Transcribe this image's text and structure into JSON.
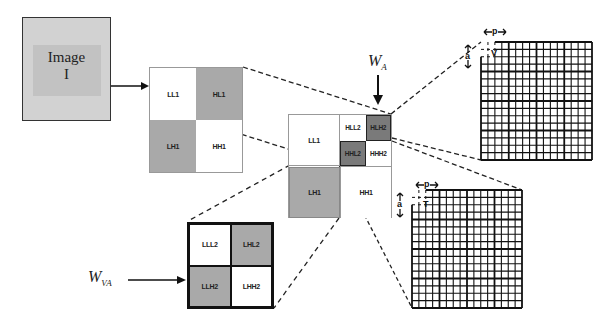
{
  "image_box": {
    "title": "Image",
    "symbol": "I"
  },
  "level1": {
    "cells": [
      "LL1",
      "HL1",
      "LH1",
      "HH1"
    ],
    "colors": [
      "#ffffff",
      "#a9a9a9",
      "#a9a9a9",
      "#ffffff"
    ]
  },
  "level2": {
    "ll1": "LL1",
    "sub": [
      "HLL2",
      "HLH2",
      "HHL2",
      "HHH2"
    ],
    "lh1": "LH1",
    "hh1": "HH1"
  },
  "level3": {
    "cells": [
      "LLL2",
      "LHL2",
      "LLH2",
      "LHH2"
    ]
  },
  "labels": {
    "wa_main": "W",
    "wa_sub": "A",
    "wva_main": "W",
    "wva_sub": "VA"
  },
  "grid_top": {
    "width_label": "p",
    "height_label": "a",
    "block_label": "V",
    "rows": 16,
    "cols": 16
  },
  "grid_bottom": {
    "width_label": "p",
    "height_label": "a",
    "block_label": "T",
    "rows": 16,
    "cols": 16
  },
  "colors": {
    "stroke": "#111111",
    "light_gray": "#a9a9a9",
    "dark_gray": "#7a7a7a",
    "image_bg": "#d2d2d2"
  }
}
